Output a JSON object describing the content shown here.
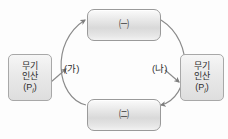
{
  "diagram": {
    "background_color": "#fdfdfd",
    "stroke_color": "#8a8a8a",
    "nodes": {
      "top_box": {
        "label": "㈠",
        "name": "circled-giyeok"
      },
      "bottom_box": {
        "label": "㈡",
        "name": "circled-nieun"
      }
    },
    "side_labels": {
      "left": {
        "line1": "무기",
        "line2": "인산",
        "formula_open": "(P",
        "formula_sub": "i",
        "formula_close": ")"
      },
      "right": {
        "line1": "무기",
        "line2": "인산",
        "formula_open": "(P",
        "formula_sub": "i",
        "formula_close": ")"
      }
    },
    "arc_captions": {
      "left": "(가)",
      "right": "(나)"
    }
  }
}
